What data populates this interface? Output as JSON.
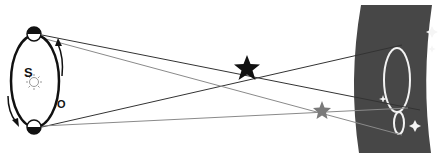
{
  "diagram": {
    "type": "stellar-parallax",
    "labels": {
      "sun": "S",
      "orbit": "O"
    },
    "elements": {
      "orbit": {
        "cx": 36,
        "cy": 81,
        "rx": 24,
        "ry": 46
      },
      "sun": {
        "x": 33,
        "y": 78
      },
      "earth_positions": [
        {
          "id": "earth-top",
          "x": 34,
          "y": 34
        },
        {
          "id": "earth-bottom",
          "x": 34,
          "y": 127
        }
      ],
      "near_star": {
        "x": 247,
        "y": 68,
        "color": "#111111"
      },
      "far_star": {
        "x": 322,
        "y": 111,
        "color": "#777777"
      },
      "background_band": {
        "color": "#474747"
      },
      "parallax_ellipse_large": {
        "cx": 398,
        "cy": 80,
        "rx": 12,
        "ry": 31
      },
      "parallax_ellipse_small": {
        "cx": 400,
        "cy": 125,
        "rx": 5,
        "ry": 11
      }
    },
    "colors": {
      "near_line": "#333333",
      "far_line": "#888888",
      "band": "#474747",
      "ellipse_stroke": "#f2f2f2"
    }
  }
}
